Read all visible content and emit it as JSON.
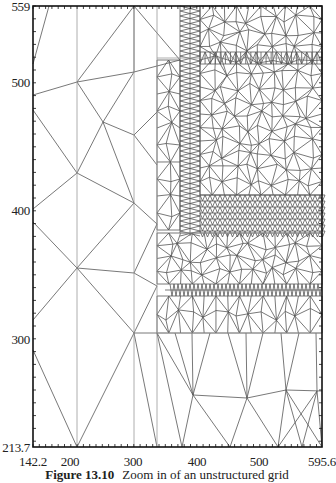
{
  "figure": {
    "caption_label": "Figure 13.10",
    "caption_text": "Zoom in of an unstructured grid"
  },
  "chart_data": {
    "type": "mesh",
    "title": "",
    "caption": "Figure 13.10 Zoom in of an unstructured grid",
    "xlabel": "",
    "ylabel": "",
    "xlim": [
      142.2,
      595.6
    ],
    "ylim": [
      213.7,
      559
    ],
    "x_ticks": [
      "142.2",
      "200",
      "300",
      "400",
      "500",
      "595.6"
    ],
    "y_ticks": [
      "213.7",
      "300",
      "400",
      "500",
      "559"
    ],
    "grid": false,
    "legend": null
  },
  "axes": {
    "y_labels": [
      {
        "text": "559",
        "y": 0
      },
      {
        "text": "500",
        "y": 76
      },
      {
        "text": "400",
        "y": 204
      },
      {
        "text": "300",
        "y": 333
      },
      {
        "text": "213.7",
        "y": 441
      }
    ],
    "x_labels": [
      {
        "text": "142.2",
        "x": 33
      },
      {
        "text": "200",
        "x": 70
      },
      {
        "text": "300",
        "x": 133
      },
      {
        "text": "400",
        "x": 197
      },
      {
        "text": "500",
        "x": 259
      },
      {
        "text": "595.6",
        "x": 322
      }
    ]
  }
}
